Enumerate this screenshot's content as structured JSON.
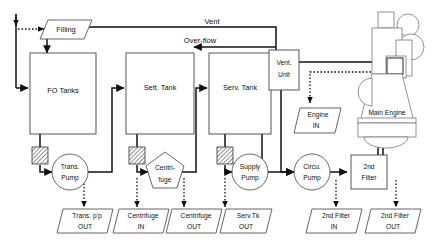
{
  "diagram": {
    "nodes": {
      "filling": "Filling",
      "fo_tanks": "FO Tanks",
      "sett_tank": "Sett. Tank",
      "serv_tank": "Serv. Tank",
      "vent_unit_line1": "Vent.",
      "vent_unit_line2": "Unit",
      "main_engine": "Main Engine",
      "engine_in_line1": "Engine",
      "engine_in_line2": "IN",
      "second_filter_line1": "2nd",
      "second_filter_line2": "Filter"
    },
    "pumps": {
      "trans_pump_line1": "Trans.",
      "trans_pump_line2": "Pump",
      "supply_pump_line1": "Supply",
      "supply_pump_line2": "Pump",
      "circu_pump_line1": "Circu.",
      "circu_pump_line2": "Pump",
      "centrifuge_line1": "Centri-",
      "centrifuge_line2": "fuge"
    },
    "flow_labels": {
      "vent": "Vent",
      "overflow": "Over-flow"
    },
    "terminals": [
      {
        "line1": "Trans. p'p",
        "line2": "OUT"
      },
      {
        "line1": "Centrifuge",
        "line2": "IN"
      },
      {
        "line1": "Centrifuge",
        "line2": "OUT"
      },
      {
        "line1": "Serv.Tk",
        "line2": "OUT"
      },
      {
        "line1": "2nd Filter",
        "line2": "IN"
      },
      {
        "line1": "2nd Filter",
        "line2": "OUT"
      }
    ],
    "colors": {
      "line": "#111111",
      "box_stroke": "#444444",
      "engine_stroke": "#777777",
      "background": "#ffffff"
    }
  }
}
